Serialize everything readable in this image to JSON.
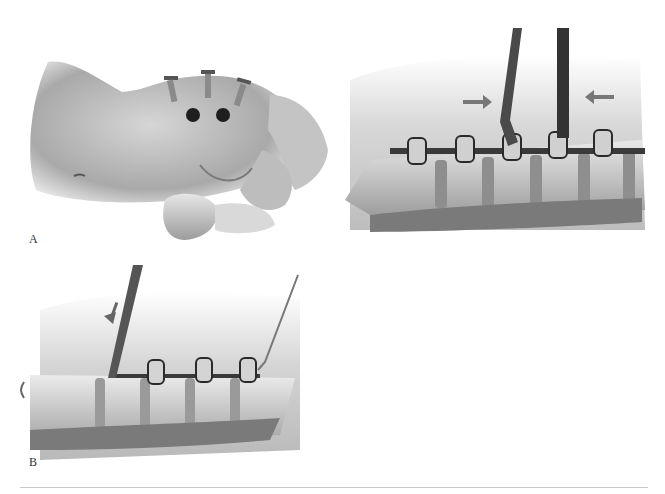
{
  "figure": {
    "panels": [
      {
        "id": "A",
        "label": "A",
        "description": "Lateral view of patient torso with three percutaneous screws inserted and two portal incisions"
      },
      {
        "id": "B",
        "label": "B",
        "description": "Spinal segment with three pedicle screw heads connected by a rod; a tool inserts the rod with a downward arrow, guide wire on right"
      },
      {
        "id": "C",
        "label": "C",
        "description": "Spinal segment with five pedicle screw heads connected by a rod; two instruments compressing, indicated by opposing arrows"
      }
    ],
    "colors": {
      "background": "#ffffff",
      "ink": "#333333",
      "skin_mid": "#b5b5b5",
      "shadow": "#6e6e6e",
      "divider": "#c8c8c8"
    }
  }
}
